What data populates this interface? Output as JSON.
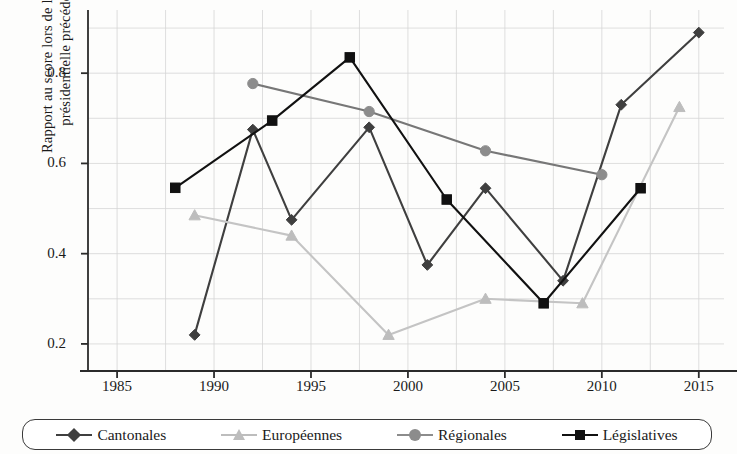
{
  "chart_data": {
    "type": "line",
    "title": "",
    "xlabel": "",
    "ylabel": "Rapport au score lors de l'élection présidentielle précédente",
    "ylabel_line1": "Rapport au score lors de l'élection",
    "ylabel_line2": "présidentielle précédente",
    "xlim": [
      1983.5,
      2016.3
    ],
    "ylim": [
      0.14,
      0.94
    ],
    "grid": true,
    "legend_position": "bottom",
    "xticks": [
      1985,
      1990,
      1995,
      2000,
      2005,
      2010,
      2015
    ],
    "xtick_labels": [
      "1985",
      "1990",
      "1995",
      "2000",
      "2005",
      "2010",
      "2015"
    ],
    "yticks": [
      0.2,
      0.4,
      0.6,
      0.8
    ],
    "ytick_labels": [
      "0.2",
      "0.4",
      "0.6",
      "0.8"
    ],
    "minor_gridlines_y": [
      0.3,
      0.5,
      0.7,
      0.9
    ],
    "minor_gridlines_x": [
      1987.5,
      1992.5,
      1997.5,
      2002.5,
      2007.5,
      2012.5
    ],
    "series": [
      {
        "name": "Cantonales",
        "marker": "diamond",
        "color": "#3f3f3f",
        "line_color": "#3f3f3f",
        "x": [
          1989,
          1992,
          1994,
          1998,
          2001,
          2004,
          2008,
          2011,
          2015
        ],
        "y": [
          0.22,
          0.675,
          0.475,
          0.68,
          0.375,
          0.545,
          0.34,
          0.73,
          0.89
        ]
      },
      {
        "name": "Européennes",
        "marker": "triangle",
        "color": "#bdbdbd",
        "line_color": "#c4c4c4",
        "x": [
          1989,
          1994,
          1999,
          2004,
          2009,
          2014
        ],
        "y": [
          0.485,
          0.44,
          0.22,
          0.3,
          0.29,
          0.725
        ]
      },
      {
        "name": "Régionales",
        "marker": "circle",
        "color": "#8c8c8c",
        "line_color": "#777777",
        "x": [
          1992,
          1998,
          2004,
          2010
        ],
        "y": [
          0.777,
          0.715,
          0.628,
          0.575
        ]
      },
      {
        "name": "Législatives",
        "marker": "square",
        "color": "#111111",
        "line_color": "#111111",
        "x": [
          1988,
          1993,
          1997,
          2002,
          2007,
          2012
        ],
        "y": [
          0.546,
          0.695,
          0.835,
          0.52,
          0.29,
          0.545
        ]
      }
    ]
  },
  "legend": {
    "items": [
      {
        "label": "Cantonales",
        "marker": "diamond",
        "color": "#3f3f3f"
      },
      {
        "label": "Européennes",
        "marker": "triangle",
        "color": "#bdbdbd"
      },
      {
        "label": "Régionales",
        "marker": "circle",
        "color": "#8c8c8c"
      },
      {
        "label": "Législatives",
        "marker": "square",
        "color": "#111111"
      }
    ]
  },
  "colors": {
    "axis": "#2b2b2b",
    "grid": "#d6d6d6",
    "background": "#fdfdfc"
  }
}
